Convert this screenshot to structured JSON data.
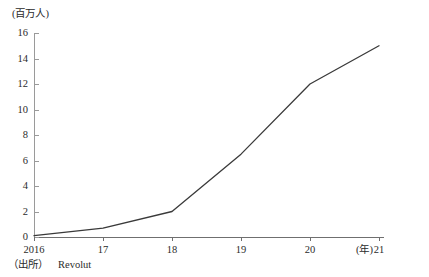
{
  "chart_data": {
    "type": "line",
    "title": "",
    "subtitle": "",
    "xlabel": "(年)",
    "ylabel": "(百万人)",
    "x": [
      "2016",
      "17",
      "18",
      "19",
      "20",
      "21"
    ],
    "categories": [
      "2016",
      "17",
      "18",
      "19",
      "20",
      "21"
    ],
    "values": [
      0.1,
      0.7,
      2.0,
      6.5,
      12.0,
      15.0
    ],
    "series": [
      {
        "name": "Revolut customers",
        "values": [
          0.1,
          0.7,
          2.0,
          6.5,
          12.0,
          15.0
        ]
      }
    ],
    "xlim": [
      "2016",
      "21"
    ],
    "ylim": [
      0,
      16
    ],
    "ytick_labels": [
      "16",
      "14",
      "12",
      "10",
      "8",
      "6",
      "4",
      "2",
      "0"
    ],
    "ytick_values": [
      16,
      14,
      12,
      10,
      8,
      6,
      4,
      2,
      0
    ],
    "xtick_labels": [
      "2016",
      "17",
      "18",
      "19",
      "20",
      "21"
    ],
    "grid": false,
    "legend": false,
    "legend_position": "none",
    "line_color": "#3a3a3a",
    "axis_color": "#7a7a7a"
  },
  "axes": {
    "y_unit_caption": "(百万人)",
    "x_unit_caption": "(年)"
  },
  "source": {
    "label": "（出所）",
    "value": "Revolut"
  }
}
